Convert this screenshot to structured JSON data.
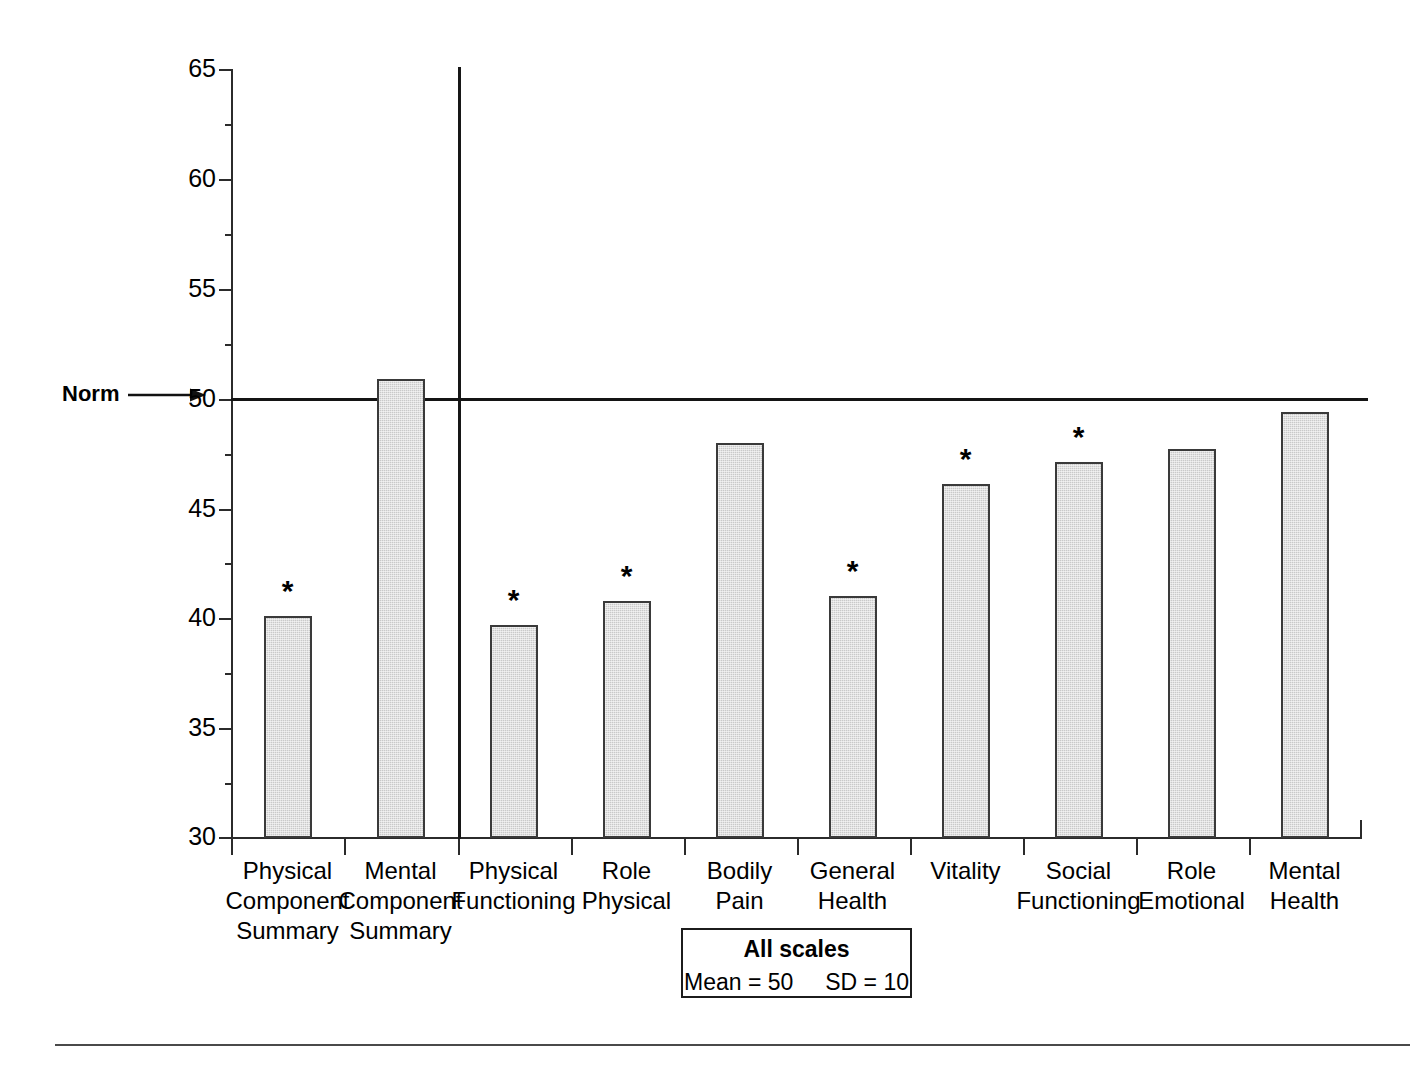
{
  "chart_data": {
    "type": "bar",
    "title": "",
    "xlabel": "",
    "ylabel": "",
    "ylim": [
      30,
      65
    ],
    "yticks": [
      30,
      35,
      40,
      45,
      50,
      55,
      60,
      65
    ],
    "ytick_labels": [
      "30",
      "35",
      "40",
      "45",
      "50",
      "55",
      "60",
      "65"
    ],
    "grid": false,
    "legend_position": "bottom-center",
    "reference_line": {
      "value": 50,
      "label": "Norm"
    },
    "significance_marker": "*",
    "categories": [
      "Physical\nComponent\nSummary",
      "Mental\nComponent\nSummary",
      "Physical\nFunctioning",
      "Role\nPhysical",
      "Bodily\nPain",
      "General\nHealth",
      "Vitality",
      "Social\nFunctioning",
      "Role\nEmotional",
      "Mental\nHealth"
    ],
    "values": [
      40.1,
      50.9,
      39.7,
      40.8,
      48.0,
      41.0,
      46.1,
      47.1,
      47.7,
      49.4
    ],
    "significant": [
      true,
      false,
      true,
      true,
      false,
      true,
      true,
      true,
      false,
      false
    ],
    "annotations": {
      "legend_title": "All scales",
      "legend_stats": "Mean = 50     SD = 10"
    }
  },
  "axis": {
    "norm_label": "Norm",
    "y_tick_labels": [
      "65",
      "60",
      "55",
      "50",
      "45",
      "40",
      "35",
      "30"
    ]
  },
  "categories": [
    {
      "line1": "Physical",
      "line2": "Component",
      "line3": "Summary"
    },
    {
      "line1": "Mental",
      "line2": "Component",
      "line3": "Summary"
    },
    {
      "line1": "Physical",
      "line2": "Functioning",
      "line3": ""
    },
    {
      "line1": "Role",
      "line2": "Physical",
      "line3": ""
    },
    {
      "line1": "Bodily",
      "line2": "Pain",
      "line3": ""
    },
    {
      "line1": "General",
      "line2": "Health",
      "line3": ""
    },
    {
      "line1": "Vitality",
      "line2": "",
      "line3": ""
    },
    {
      "line1": "Social",
      "line2": "Functioning",
      "line3": ""
    },
    {
      "line1": "Role",
      "line2": "Emotional",
      "line3": ""
    },
    {
      "line1": "Mental",
      "line2": "Health",
      "line3": ""
    }
  ],
  "category_labels": [
    "Physical\nComponent\nSummary",
    "Mental\nComponent\nSummary",
    "Physical\nFunctioning",
    "Role\nPhysical",
    "Bodily\nPain",
    "General\nHealth",
    "Vitality",
    "Social\nFunctioning",
    "Role\nEmotional",
    "Mental\nHealth"
  ],
  "legend": {
    "title": "All scales",
    "stats": "Mean = 50     SD = 10",
    "mean": "50",
    "sd": "10"
  },
  "markers": {
    "star": "*"
  },
  "colors": {
    "bar_fill": "#c9c9c9",
    "bar_stroke": "#3a3a3a",
    "axis": "#2b2b2b",
    "norm_line": "#141414",
    "text": "#000000"
  }
}
